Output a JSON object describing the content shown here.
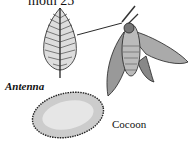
{
  "title": "moth 25",
  "labels": {
    "antenna": "Antenna",
    "cocoon": "Cocoon"
  },
  "figures": [
    "antenna-illustration",
    "moth-illustration",
    "cocoon-illustration"
  ],
  "colors": {
    "ink": "#111111",
    "shade": "#888888",
    "background": "#ffffff"
  }
}
